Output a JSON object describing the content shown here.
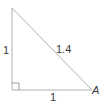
{
  "diagram": {
    "type": "right-triangle",
    "colors": {
      "line": "#b0b0b0",
      "text": "#3a3a3a",
      "background": "#ffffff"
    },
    "vertices": {
      "top": {
        "x": 12,
        "y": 8,
        "label": ""
      },
      "right_angle": {
        "x": 12,
        "y": 90,
        "label": ""
      },
      "right": {
        "x": 92,
        "y": 90,
        "label": "A"
      }
    },
    "labels": {
      "vertical_leg": "1",
      "horizontal_leg": "1",
      "hypotenuse": "1.4",
      "vertex_a": "A"
    },
    "right_angle_marker": true
  }
}
